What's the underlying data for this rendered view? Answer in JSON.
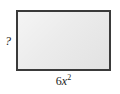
{
  "figure": {
    "type": "geometry-diagram",
    "shape": "rectangle",
    "background_color": "#ffffff",
    "fill_color": "#e9e9e9",
    "border_color": "#3a3a3a",
    "text_color": "#1a1a1a",
    "labels": {
      "unknown_side": "?",
      "width": {
        "full": "6x2",
        "coefficient": "6",
        "variable": "x",
        "exponent": "2"
      }
    }
  }
}
